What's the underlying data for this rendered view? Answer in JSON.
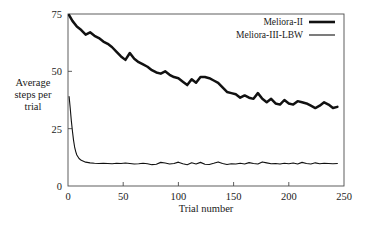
{
  "chart_data": {
    "type": "line",
    "title": "",
    "xlabel": "Trial number",
    "ylabel": "Average steps per trial",
    "ylabel_lines": [
      "Average",
      "steps per",
      "trial"
    ],
    "xlim": [
      0,
      250
    ],
    "ylim": [
      0,
      75
    ],
    "xticks": [
      0,
      50,
      100,
      150,
      200,
      250
    ],
    "xticklabels": [
      "0",
      "50",
      "100",
      "150",
      "200",
      "250"
    ],
    "yticks": [
      0,
      25,
      50,
      75
    ],
    "yticklabels": [
      "0",
      "25",
      "50",
      "75"
    ],
    "grid": false,
    "legend_position": "top-right",
    "series": [
      {
        "name": "Meliora-II",
        "style": "thick",
        "color": "#111111",
        "x": [
          1,
          4,
          8,
          12,
          16,
          20,
          24,
          28,
          32,
          36,
          40,
          44,
          48,
          52,
          56,
          60,
          64,
          68,
          72,
          76,
          80,
          84,
          88,
          92,
          96,
          100,
          104,
          108,
          112,
          116,
          120,
          124,
          128,
          132,
          136,
          140,
          144,
          148,
          152,
          156,
          160,
          164,
          168,
          172,
          176,
          180,
          184,
          188,
          192,
          196,
          200,
          204,
          208,
          212,
          216,
          220,
          224,
          228,
          232,
          236,
          240,
          244
        ],
        "y": [
          74.5,
          72.0,
          69.5,
          68.0,
          66.0,
          67.0,
          65.5,
          64.5,
          63.0,
          62.0,
          60.5,
          58.5,
          56.5,
          55.0,
          58.0,
          55.5,
          54.0,
          53.0,
          52.0,
          50.5,
          49.5,
          49.0,
          50.0,
          48.5,
          47.5,
          47.0,
          45.5,
          44.0,
          46.5,
          45.0,
          47.5,
          47.5,
          47.0,
          46.0,
          45.0,
          43.0,
          41.0,
          40.5,
          40.0,
          38.5,
          39.5,
          38.5,
          38.0,
          40.5,
          38.0,
          36.5,
          38.0,
          36.0,
          35.5,
          37.5,
          36.0,
          35.5,
          37.0,
          36.5,
          36.0,
          35.0,
          34.0,
          35.0,
          36.5,
          35.5,
          34.0,
          34.5
        ]
      },
      {
        "name": "Meliora-III-LBW",
        "style": "thin",
        "color": "#111111",
        "x": [
          1,
          2,
          3,
          4,
          5,
          6,
          7,
          8,
          10,
          12,
          14,
          16,
          20,
          24,
          28,
          32,
          36,
          40,
          44,
          48,
          52,
          56,
          60,
          64,
          68,
          72,
          76,
          80,
          84,
          88,
          92,
          96,
          100,
          104,
          108,
          112,
          116,
          120,
          124,
          128,
          132,
          136,
          140,
          144,
          148,
          152,
          156,
          160,
          164,
          168,
          172,
          176,
          180,
          184,
          188,
          192,
          196,
          200,
          204,
          208,
          212,
          216,
          220,
          224,
          228,
          232,
          236,
          240,
          244
        ],
        "y": [
          39.0,
          34.0,
          28.5,
          24.0,
          20.0,
          17.0,
          15.0,
          13.5,
          12.0,
          11.2,
          10.8,
          10.4,
          10.1,
          9.9,
          9.8,
          9.9,
          9.8,
          9.7,
          9.9,
          9.8,
          10.0,
          9.8,
          9.6,
          9.7,
          9.9,
          9.7,
          9.3,
          9.5,
          10.3,
          10.0,
          9.6,
          9.8,
          10.4,
          9.7,
          9.3,
          10.1,
          9.6,
          10.3,
          9.5,
          9.4,
          9.9,
          10.5,
          9.8,
          9.4,
          9.7,
          9.6,
          9.9,
          9.6,
          10.2,
          9.8,
          9.6,
          10.5,
          10.1,
          9.7,
          9.8,
          9.6,
          9.9,
          9.7,
          10.0,
          9.6,
          10.3,
          9.8,
          9.6,
          10.1,
          9.7,
          9.9,
          9.8,
          9.7,
          9.8
        ]
      }
    ]
  },
  "legend": {
    "items": [
      {
        "label": "Meliora-II"
      },
      {
        "label": "Meliora-III-LBW"
      }
    ]
  }
}
